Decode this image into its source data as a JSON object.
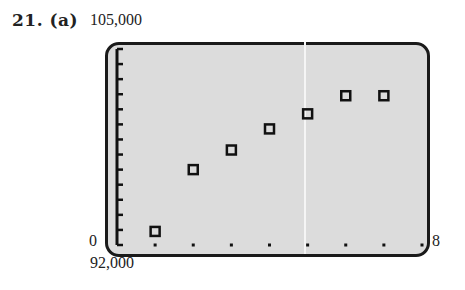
{
  "problem": {
    "number": "21.",
    "part": "(a)"
  },
  "axis_labels": {
    "y_max": "105,000",
    "y_min": "92,000",
    "x_min": "0",
    "x_max": "8"
  },
  "chart_data": {
    "type": "scatter",
    "title": "21. (a)",
    "xlabel": "",
    "ylabel": "",
    "xlim": [
      0,
      8
    ],
    "ylim": [
      92000,
      105000
    ],
    "x_tick_step": 1,
    "y_tick_step": 1000,
    "grid": false,
    "marker": "square",
    "x": [
      1,
      2,
      3,
      4,
      5,
      6,
      7
    ],
    "y": [
      92900,
      97000,
      98300,
      99700,
      100700,
      101900,
      101900
    ]
  },
  "colors": {
    "screen_bg": "#dcdcdc",
    "frame": "#1a1a1a",
    "marker": "#111111"
  }
}
